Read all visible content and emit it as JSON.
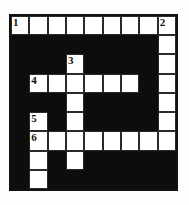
{
  "puzzle": {
    "title": "Crossword Grid",
    "rows": 9,
    "columns": 9,
    "colors": {
      "block": "#0d0d0d",
      "open": "#ffffff",
      "border": "#111111",
      "page_background": "#fdfdfb",
      "number_text": "#111111"
    },
    "numbers": {
      "n1": "1",
      "n2": "2",
      "n3": "3",
      "n4": "4",
      "n5": "5",
      "n6": "6"
    },
    "clue_numbers_list": [
      "1",
      "2",
      "3",
      "4",
      "5",
      "6"
    ],
    "grid": [
      [
        "white",
        "white",
        "white",
        "white",
        "white",
        "white",
        "white",
        "white",
        "white"
      ],
      [
        "black",
        "black",
        "black",
        "black",
        "black",
        "black",
        "black",
        "black",
        "white"
      ],
      [
        "black",
        "black",
        "black",
        "white",
        "black",
        "black",
        "black",
        "black",
        "white"
      ],
      [
        "black",
        "white",
        "white",
        "white",
        "white",
        "white",
        "white",
        "black",
        "white"
      ],
      [
        "black",
        "black",
        "black",
        "white",
        "black",
        "black",
        "black",
        "black",
        "white"
      ],
      [
        "black",
        "white",
        "black",
        "white",
        "black",
        "black",
        "black",
        "black",
        "white"
      ],
      [
        "black",
        "white",
        "white",
        "white",
        "white",
        "white",
        "white",
        "white",
        "white"
      ],
      [
        "black",
        "white",
        "black",
        "white",
        "black",
        "black",
        "black",
        "black",
        "black"
      ],
      [
        "black",
        "white",
        "black",
        "black",
        "black",
        "black",
        "black",
        "black",
        "black"
      ]
    ],
    "numbered_cells": [
      {
        "row": 1,
        "col": 1,
        "number": "1"
      },
      {
        "row": 1,
        "col": 9,
        "number": "2"
      },
      {
        "row": 3,
        "col": 4,
        "number": "3"
      },
      {
        "row": 4,
        "col": 2,
        "number": "4"
      },
      {
        "row": 6,
        "col": 2,
        "number": "5"
      },
      {
        "row": 7,
        "col": 2,
        "number": "6"
      }
    ],
    "entries": {
      "across": [
        {
          "number": "1",
          "row": 1,
          "col": 1,
          "length": 9
        },
        {
          "number": "4",
          "row": 4,
          "col": 2,
          "length": 6
        },
        {
          "number": "6",
          "row": 7,
          "col": 2,
          "length": 8
        }
      ],
      "down": [
        {
          "number": "1",
          "row": 1,
          "col": 1,
          "length": 1
        },
        {
          "number": "2",
          "row": 1,
          "col": 9,
          "length": 7
        },
        {
          "number": "3",
          "row": 3,
          "col": 4,
          "length": 6
        },
        {
          "number": "5",
          "row": 6,
          "col": 2,
          "length": 4
        }
      ]
    }
  }
}
